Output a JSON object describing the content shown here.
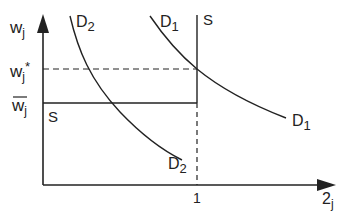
{
  "diagram": {
    "axes": {
      "y_label": "w",
      "y_label_sub": "j",
      "x_label": "2",
      "x_label_sub": "j"
    },
    "y_ticks": {
      "w_star": "w",
      "w_star_sub": "j",
      "w_star_sup": "*",
      "w_bar": "w",
      "w_bar_sub": "j"
    },
    "x_ticks": {
      "one": "1"
    },
    "curves": {
      "d1_top": "D",
      "d1_top_sub": "1",
      "d1_bottom": "D",
      "d1_bottom_sub": "1",
      "d2_top": "D",
      "d2_top_sub": "2",
      "d2_bottom": "D",
      "d2_bottom_sub": "2",
      "s_top": "S",
      "s_left": "S"
    },
    "colors": {
      "ink": "#222222",
      "background": "#ffffff"
    }
  }
}
